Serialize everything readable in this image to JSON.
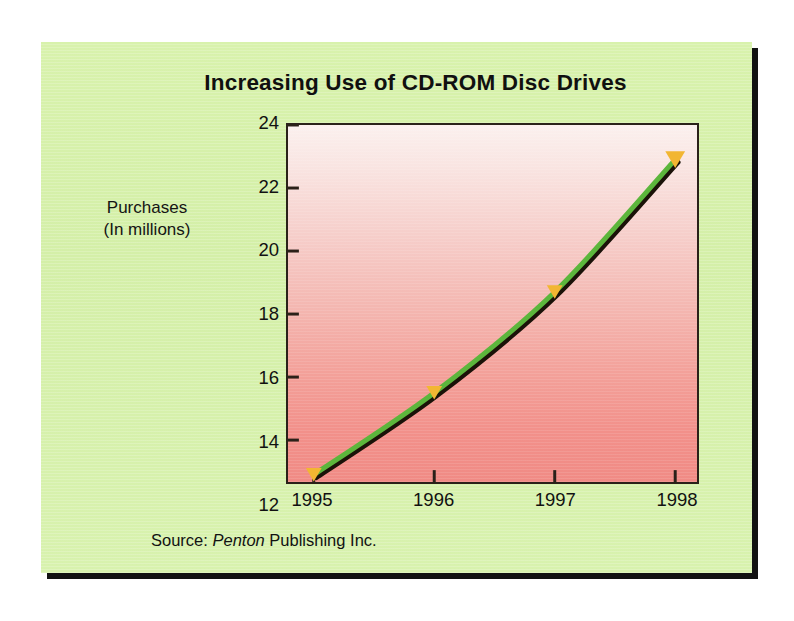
{
  "figure": {
    "title": "Increasing Use of CD-ROM Disc Drives",
    "y_axis_title_line1": "Purchases",
    "y_axis_title_line2": "(In millions)",
    "source_prefix": "Source: ",
    "source_emphasis": "Penton",
    "source_suffix": " Publishing Inc.",
    "panel_color": "#d6f0aa",
    "border_color": "#121212",
    "line_color": "#5cb63c",
    "line_shadow_color": "#1a1208",
    "marker_color": "#f2b632",
    "plot_top_color": "#fbf0ee",
    "plot_bottom_color": "#f08b85"
  },
  "chart_data": {
    "type": "line",
    "title": "Increasing Use of CD-ROM Disc Drives",
    "xlabel": "",
    "ylabel": "Purchases (In millions)",
    "categories": [
      "1995",
      "1996",
      "1997",
      "1998"
    ],
    "x": [
      1995,
      1996,
      1997,
      1998
    ],
    "values": [
      12.9,
      15.5,
      18.7,
      22.9
    ],
    "series": [
      {
        "name": "CD-ROM disc drive purchases",
        "values": [
          12.9,
          15.5,
          18.7,
          22.9
        ]
      }
    ],
    "ylim": [
      12.67,
      24
    ],
    "yticks": [
      12,
      14,
      16,
      18,
      20,
      22,
      24
    ],
    "ytick_labels": [
      "12",
      "14",
      "16",
      "18",
      "20",
      "22",
      "24"
    ],
    "xticks": [
      1995,
      1996,
      1997,
      1998
    ],
    "xtick_labels": [
      "1995",
      "1996",
      "1997",
      "1998"
    ],
    "grid": false,
    "legend": false,
    "marker": "triangle-down",
    "marker_color": "#f2b632",
    "line_color": "#5cb63c",
    "annotation": "Source: Penton Publishing Inc."
  }
}
